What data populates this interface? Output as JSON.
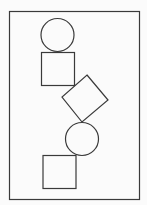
{
  "canvas": {
    "width": 147,
    "height": 205,
    "background": "#fbfbfb",
    "stroke_color": "#3a3a3a"
  },
  "frame": {
    "x": 9.5,
    "y": 11.5,
    "width": 130,
    "height": 188
  },
  "shapes": [
    {
      "type": "circle",
      "name": "circle-top",
      "cx": 57.5,
      "cy": 35,
      "r": 16.5
    },
    {
      "type": "square",
      "name": "square-top",
      "x": 41.5,
      "y": 52.5,
      "width": 33,
      "height": 33
    },
    {
      "type": "diamond",
      "name": "diamond-middle",
      "points": "87,75 108,100 82,122 62,97"
    },
    {
      "type": "circle",
      "name": "circle-bottom",
      "cx": 82,
      "cy": 139,
      "r": 16.5
    },
    {
      "type": "square",
      "name": "square-bottom",
      "x": 43,
      "y": 155.5,
      "width": 33,
      "height": 33
    }
  ]
}
